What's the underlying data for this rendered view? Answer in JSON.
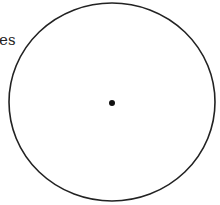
{
  "diagram": {
    "label_text": "es",
    "circle": {
      "cx": 112,
      "cy": 102,
      "rx": 103,
      "ry": 99,
      "stroke": "#222222"
    },
    "center_dot": {
      "cx": 112,
      "cy": 103,
      "r": 3,
      "fill": "#111111"
    }
  }
}
